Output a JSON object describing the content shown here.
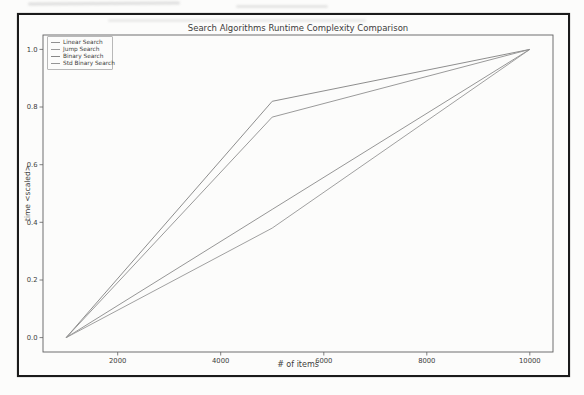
{
  "page": {
    "background": "#fcfcfb",
    "frame_color": "#1b1b1b"
  },
  "chart_data": {
    "type": "line",
    "title": "Search Algorithms Runtime Complexity Comparison",
    "xlabel": "# of items",
    "ylabel": "time <scaled>",
    "x": [
      1000,
      5000,
      10000
    ],
    "series": [
      {
        "name": "Linear Search",
        "color": "#909090",
        "values": [
          0.0,
          0.445,
          1.0
        ]
      },
      {
        "name": "Jump Search",
        "color": "#9b9b9b",
        "values": [
          0.0,
          0.38,
          1.0
        ]
      },
      {
        "name": "Binary Search",
        "color": "#878787",
        "values": [
          0.0,
          0.82,
          1.0
        ]
      },
      {
        "name": "Std Binary Search",
        "color": "#959595",
        "values": [
          0.0,
          0.765,
          1.0
        ]
      }
    ],
    "xlim": [
      550,
      10450
    ],
    "ylim": [
      -0.05,
      1.05
    ],
    "xticks": [
      2000,
      4000,
      6000,
      8000,
      10000
    ],
    "xtick_labels": [
      "2000",
      "4000",
      "6000",
      "8000",
      "10000"
    ],
    "yticks": [
      0.0,
      0.2,
      0.4,
      0.6,
      0.8,
      1.0
    ],
    "ytick_labels": [
      "0.0",
      "0.2",
      "0.4",
      "0.6",
      "0.8",
      "1.0"
    ],
    "grid": false,
    "legend_position": "upper left",
    "axis_color": "#616161",
    "text_color": "#3c3c3c"
  }
}
